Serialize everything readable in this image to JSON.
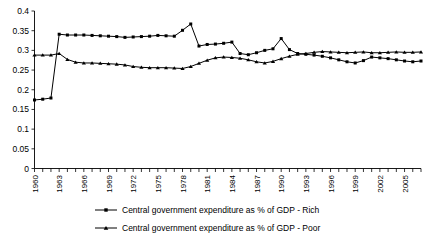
{
  "chart_data": {
    "type": "line",
    "title": "",
    "xlabel": "",
    "ylabel": "",
    "ylim": [
      0,
      0.4
    ],
    "ytick_step": 0.05,
    "yticks": [
      "0",
      "0.05",
      "0.1",
      "0.15",
      "0.2",
      "0.25",
      "0.3",
      "0.35",
      "0.4"
    ],
    "ytick_values": [
      0,
      0.05,
      0.1,
      0.15,
      0.2,
      0.25,
      0.3,
      0.35,
      0.4
    ],
    "grid": false,
    "legend_position": "bottom",
    "x": [
      1960,
      1961,
      1962,
      1963,
      1964,
      1965,
      1966,
      1967,
      1968,
      1969,
      1970,
      1971,
      1972,
      1973,
      1974,
      1975,
      1976,
      1977,
      1978,
      1979,
      1980,
      1981,
      1982,
      1983,
      1984,
      1985,
      1986,
      1987,
      1988,
      1989,
      1990,
      1991,
      1992,
      1993,
      1994,
      1995,
      1996,
      1997,
      1998,
      1999,
      2000,
      2001,
      2002,
      2003,
      2004,
      2005,
      2006,
      2007
    ],
    "xtick_labels": [
      "1960",
      "1963",
      "1966",
      "1969",
      "1972",
      "1975",
      "1978",
      "1981",
      "1984",
      "1987",
      "1990",
      "1993",
      "1996",
      "1999",
      "2002",
      "2005"
    ],
    "xtick_label_values": [
      1960,
      1963,
      1966,
      1969,
      1972,
      1975,
      1978,
      1981,
      1984,
      1987,
      1990,
      1993,
      1996,
      1999,
      2002,
      2005
    ],
    "xlim": [
      1960,
      2007
    ],
    "series": [
      {
        "name": "Central government expenditure as % of GDP - Rich",
        "marker": "square",
        "color": "#000000",
        "values": [
          0.174,
          0.176,
          0.179,
          0.341,
          0.339,
          0.339,
          0.339,
          0.338,
          0.337,
          0.336,
          0.335,
          0.333,
          0.334,
          0.335,
          0.336,
          0.338,
          0.337,
          0.336,
          0.351,
          0.367,
          0.311,
          0.315,
          0.316,
          0.318,
          0.321,
          0.292,
          0.289,
          0.294,
          0.3,
          0.304,
          0.33,
          0.302,
          0.292,
          0.29,
          0.288,
          0.285,
          0.281,
          0.276,
          0.271,
          0.268,
          0.274,
          0.283,
          0.281,
          0.279,
          0.276,
          0.273,
          0.271,
          0.273
        ]
      },
      {
        "name": "Central government expenditure as % of GDP - Poor",
        "marker": "triangle",
        "color": "#000000",
        "values": [
          0.288,
          0.288,
          0.288,
          0.292,
          0.277,
          0.27,
          0.268,
          0.268,
          0.267,
          0.266,
          0.265,
          0.263,
          0.259,
          0.257,
          0.256,
          0.256,
          0.256,
          0.255,
          0.254,
          0.259,
          0.267,
          0.275,
          0.281,
          0.283,
          0.282,
          0.28,
          0.276,
          0.271,
          0.268,
          0.272,
          0.279,
          0.285,
          0.29,
          0.292,
          0.295,
          0.297,
          0.296,
          0.295,
          0.294,
          0.295,
          0.296,
          0.294,
          0.294,
          0.295,
          0.296,
          0.295,
          0.295,
          0.296
        ]
      }
    ]
  },
  "legend": {
    "items": [
      {
        "label": "Central government expenditure as % of GDP - Rich",
        "marker": "square"
      },
      {
        "label": "Central government expenditure as % of GDP - Poor",
        "marker": "triangle"
      }
    ]
  }
}
